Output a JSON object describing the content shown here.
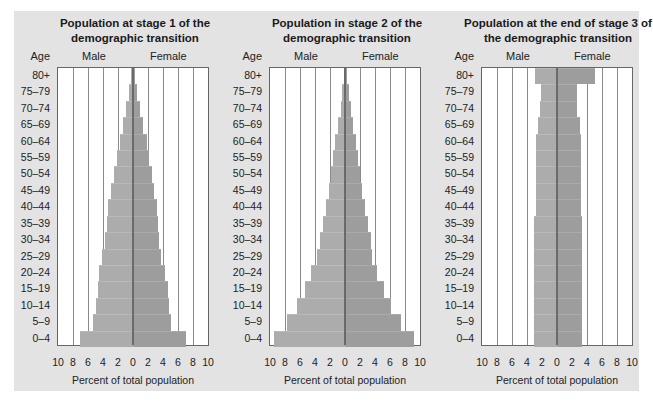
{
  "chart_data": [
    {
      "type": "bar",
      "subtype": "population-pyramid",
      "title": "Population at stage 1 of the demographic transition",
      "title_lines": [
        "Population at stage 1 of the",
        "demographic transition"
      ],
      "ylabel": "Age",
      "xlabel": "Percent of total population",
      "left_label": "Male",
      "right_label": "Female",
      "xlim": [
        -10,
        10
      ],
      "xticks": [
        "10",
        "8",
        "6",
        "4",
        "2",
        "0",
        "2",
        "4",
        "6",
        "8",
        "10"
      ],
      "grid": true,
      "categories": [
        "80+",
        "75–79",
        "70–74",
        "65–69",
        "60–64",
        "55–59",
        "50–54",
        "45–49",
        "40–44",
        "35–39",
        "30–34",
        "25–29",
        "20–24",
        "15–19",
        "10–14",
        "5–9",
        "0–4"
      ],
      "series": [
        {
          "name": "Male",
          "values": [
            0.3,
            0.5,
            0.9,
            1.3,
            1.7,
            2.1,
            2.5,
            2.9,
            3.3,
            3.5,
            3.7,
            4.1,
            4.5,
            4.7,
            4.9,
            5.3,
            7.1
          ]
        },
        {
          "name": "Female",
          "values": [
            0.3,
            0.5,
            0.9,
            1.3,
            1.8,
            2.1,
            2.5,
            2.8,
            3.2,
            3.3,
            3.4,
            3.7,
            4.2,
            4.6,
            4.8,
            5.1,
            7.0
          ]
        }
      ]
    },
    {
      "type": "bar",
      "subtype": "population-pyramid",
      "title": "Population in stage 2 of the demographic transition",
      "title_lines": [
        "Population in stage 2 of the",
        "demographic transition"
      ],
      "ylabel": "Age",
      "xlabel": "Percent of total population",
      "left_label": "Male",
      "right_label": "Female",
      "xlim": [
        -10,
        10
      ],
      "xticks": [
        "10",
        "8",
        "6",
        "4",
        "2",
        "0",
        "2",
        "4",
        "6",
        "8",
        "10"
      ],
      "grid": true,
      "categories": [
        "80+",
        "75–79",
        "70–74",
        "65–69",
        "60–64",
        "55–59",
        "50–54",
        "45–49",
        "40–44",
        "35–39",
        "30–34",
        "25–29",
        "20–24",
        "15–19",
        "10–14",
        "5–9",
        "0–4"
      ],
      "series": [
        {
          "name": "Male",
          "values": [
            0.2,
            0.4,
            0.6,
            1.0,
            1.3,
            1.6,
            1.9,
            2.2,
            2.6,
            3.0,
            3.4,
            3.7,
            4.5,
            5.4,
            6.4,
            7.8,
            9.5
          ]
        },
        {
          "name": "Female",
          "values": [
            0.2,
            0.5,
            0.8,
            1.1,
            1.4,
            1.7,
            2.0,
            2.3,
            2.7,
            3.0,
            3.4,
            3.6,
            4.2,
            5.2,
            6.1,
            7.5,
            9.2
          ]
        }
      ]
    },
    {
      "type": "bar",
      "subtype": "population-pyramid",
      "title": "Population at the end of stage 3 of the demographic transition",
      "title_lines": [
        "Population at the end of stage 3 of",
        "the demographic transition"
      ],
      "ylabel": "Age",
      "xlabel": "Percent of total population",
      "left_label": "Male",
      "right_label": "Female",
      "xlim": [
        -10,
        10
      ],
      "xticks": [
        "10",
        "8",
        "6",
        "4",
        "2",
        "0",
        "2",
        "4",
        "6",
        "8",
        "10"
      ],
      "grid": true,
      "categories": [
        "80+",
        "75–79",
        "70–74",
        "65–69",
        "60–64",
        "55–59",
        "50–54",
        "45–49",
        "40–44",
        "35–39",
        "30–34",
        "25–29",
        "20–24",
        "15–19",
        "10–14",
        "5–9",
        "0–4"
      ],
      "series": [
        {
          "name": "Male",
          "values": [
            2.9,
            2.1,
            2.3,
            2.6,
            2.8,
            2.8,
            2.8,
            2.8,
            2.8,
            3.1,
            3.1,
            3.1,
            3.1,
            3.1,
            3.1,
            3.1,
            3.1
          ]
        },
        {
          "name": "Female",
          "values": [
            5.1,
            2.6,
            2.7,
            3.0,
            3.2,
            3.2,
            3.2,
            3.2,
            3.2,
            3.3,
            3.3,
            3.3,
            3.3,
            3.3,
            3.3,
            3.3,
            3.3
          ]
        }
      ]
    }
  ],
  "colors": {
    "background": "#e3e3e3",
    "plot_background": "#ffffff",
    "male_bar": "#acacac",
    "female_bar": "#9d9d9d",
    "gridline": "#8a8a8a",
    "center_line": "#6a6a6a"
  }
}
